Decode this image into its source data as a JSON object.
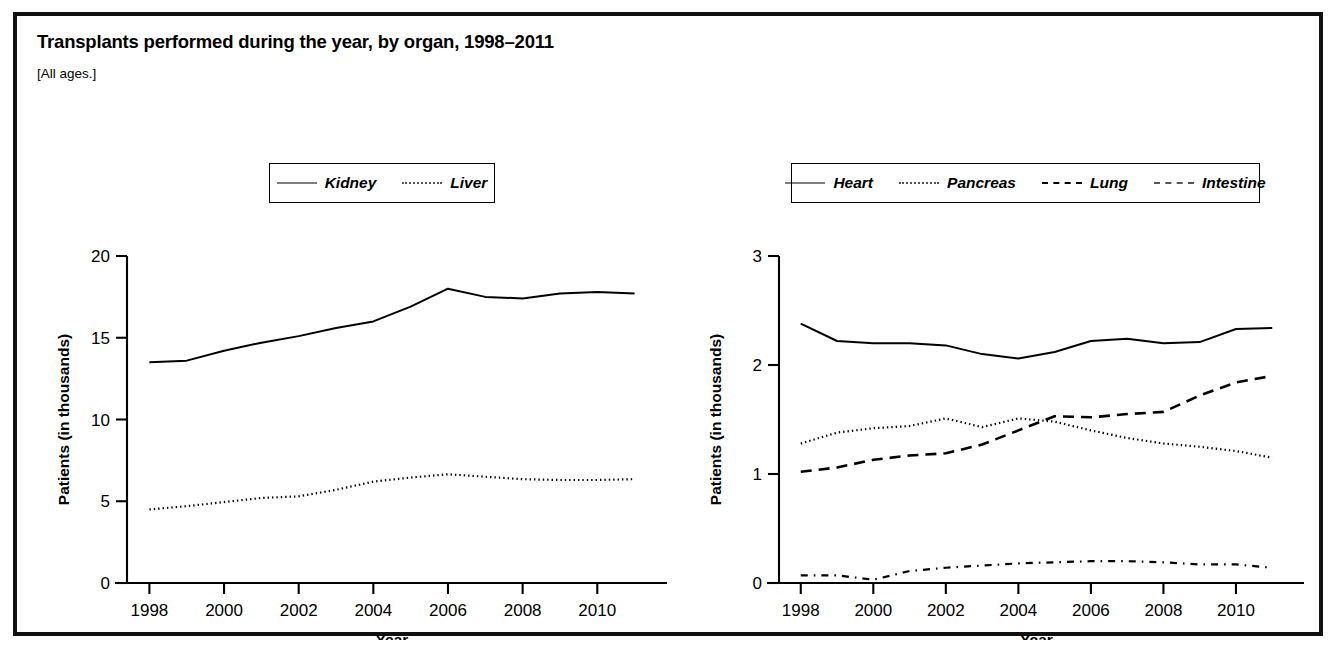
{
  "figure": {
    "title": "Transplants performed during the year, by organ, 1998–2011",
    "subtitle": "[All ages.]"
  },
  "chart_data": [
    {
      "type": "line",
      "panel": "left",
      "title": "",
      "xlabel": "Year",
      "ylabel": "Patients (in thousands)",
      "x": [
        1998,
        1999,
        2000,
        2001,
        2002,
        2003,
        2004,
        2005,
        2006,
        2007,
        2008,
        2009,
        2010,
        2011
      ],
      "xlim": [
        1997.4,
        2011.6
      ],
      "ylim": [
        0,
        20
      ],
      "xticks": [
        1998,
        2000,
        2002,
        2004,
        2006,
        2008,
        2010
      ],
      "yticks": [
        0,
        5,
        10,
        15,
        20
      ],
      "grid": false,
      "legend_position": "top-center",
      "series": [
        {
          "name": "Kidney",
          "style": "solid",
          "values": [
            13.5,
            13.6,
            14.2,
            14.7,
            15.1,
            15.6,
            16.0,
            16.9,
            18.0,
            17.5,
            17.4,
            17.7,
            17.8,
            17.7
          ]
        },
        {
          "name": "Liver",
          "style": "dotted",
          "values": [
            4.5,
            4.7,
            4.95,
            5.2,
            5.3,
            5.7,
            6.2,
            6.45,
            6.65,
            6.5,
            6.35,
            6.3,
            6.3,
            6.35
          ]
        }
      ]
    },
    {
      "type": "line",
      "panel": "right",
      "title": "",
      "xlabel": "Year",
      "ylabel": "Patients (in thousands)",
      "x": [
        1998,
        1999,
        2000,
        2001,
        2002,
        2003,
        2004,
        2005,
        2006,
        2007,
        2008,
        2009,
        2010,
        2011
      ],
      "xlim": [
        1997.4,
        2011.6
      ],
      "ylim": [
        0,
        3
      ],
      "xticks": [
        1998,
        2000,
        2002,
        2004,
        2006,
        2008,
        2010
      ],
      "yticks": [
        0,
        1,
        2,
        3
      ],
      "grid": false,
      "legend_position": "top-center",
      "series": [
        {
          "name": "Heart",
          "style": "solid",
          "values": [
            2.38,
            2.22,
            2.2,
            2.2,
            2.18,
            2.1,
            2.06,
            2.12,
            2.22,
            2.24,
            2.2,
            2.21,
            2.33,
            2.34
          ]
        },
        {
          "name": "Pancreas",
          "style": "dotted",
          "values": [
            1.28,
            1.38,
            1.42,
            1.44,
            1.51,
            1.43,
            1.51,
            1.48,
            1.4,
            1.33,
            1.28,
            1.25,
            1.21,
            1.15
          ]
        },
        {
          "name": "Lung",
          "style": "dashed",
          "values": [
            1.02,
            1.06,
            1.13,
            1.17,
            1.19,
            1.27,
            1.4,
            1.53,
            1.52,
            1.55,
            1.57,
            1.72,
            1.84,
            1.9
          ]
        },
        {
          "name": "Intestine",
          "style": "dashdot",
          "values": [
            0.07,
            0.07,
            0.03,
            0.11,
            0.14,
            0.16,
            0.18,
            0.19,
            0.2,
            0.2,
            0.19,
            0.17,
            0.17,
            0.14
          ]
        }
      ]
    }
  ]
}
